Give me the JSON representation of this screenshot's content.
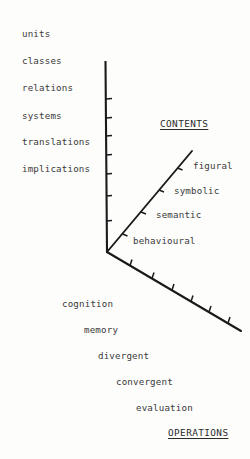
{
  "figure": {
    "kind": "three-axis-structure-of-intellect-diagram",
    "background_color": "#fdfdfc",
    "line_color": "#1a1a1a",
    "text_color": "#3a3a3a"
  },
  "axes": {
    "products": {
      "title": "",
      "orientation": "vertical-up-left-labels",
      "labels": [
        {
          "text": "units",
          "x": 22,
          "y": 29
        },
        {
          "text": "classes",
          "x": 22,
          "y": 56
        },
        {
          "text": "relations",
          "x": 22,
          "y": 83
        },
        {
          "text": "systems",
          "x": 22,
          "y": 111
        },
        {
          "text": "translations",
          "x": 22,
          "y": 137
        },
        {
          "text": "implications",
          "x": 22,
          "y": 164
        }
      ],
      "tick_count": 7
    },
    "contents": {
      "title": "CONTENTS",
      "title_x": 160,
      "title_y": 119,
      "orientation": "diagonal-up-right",
      "labels": [
        {
          "text": "figural",
          "x": 193,
          "y": 161
        },
        {
          "text": "symbolic",
          "x": 174,
          "y": 186
        },
        {
          "text": "semantic",
          "x": 156,
          "y": 210
        },
        {
          "text": "behavioural",
          "x": 133,
          "y": 236
        }
      ],
      "tick_count": 4
    },
    "operations": {
      "title": "OPERATIONS",
      "title_x": 168,
      "title_y": 428,
      "orientation": "diagonal-down-right",
      "labels": [
        {
          "text": "cognition",
          "x": 62,
          "y": 299
        },
        {
          "text": "memory",
          "x": 84,
          "y": 325
        },
        {
          "text": "divergent",
          "x": 98,
          "y": 351
        },
        {
          "text": "convergent",
          "x": 116,
          "y": 377
        },
        {
          "text": "evaluation",
          "x": 136,
          "y": 403
        }
      ],
      "tick_count": 6
    }
  },
  "geometry": {
    "origin": {
      "x": 107,
      "y": 252
    },
    "vertical_top": {
      "x": 105,
      "y": 62
    },
    "contents_end": {
      "x": 192,
      "y": 151
    },
    "operations_end": {
      "x": 241,
      "y": 331
    }
  }
}
